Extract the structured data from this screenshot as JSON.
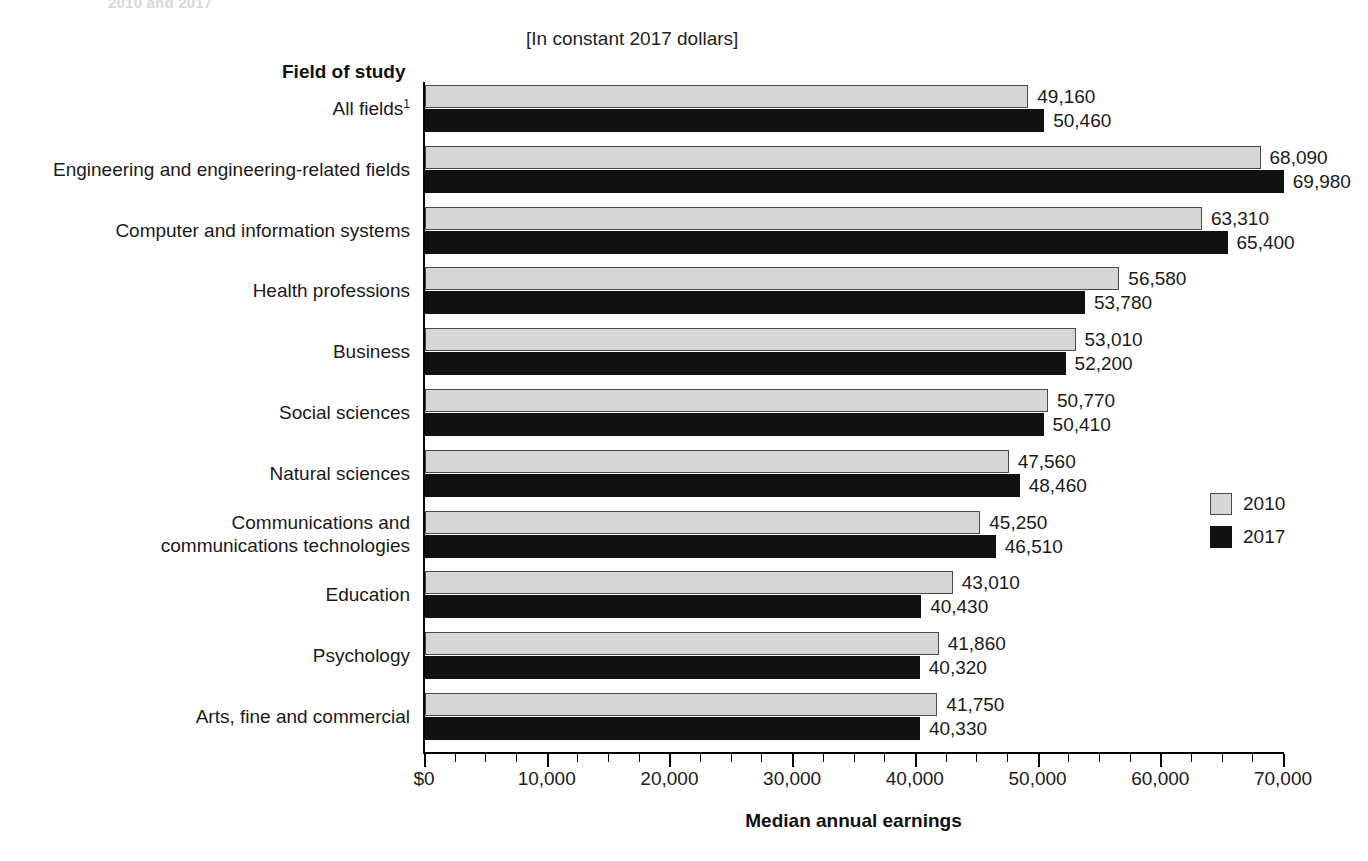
{
  "top_remnant": "2010 and 2017",
  "subtitle": "[In constant 2017 dollars]",
  "field_of_study_header": "Field of study",
  "x_axis_title": "Median annual earnings",
  "legend": {
    "position": "right",
    "entries": [
      {
        "label": "2010",
        "color": "#d6d6d6"
      },
      {
        "label": "2017",
        "color": "#111111"
      }
    ]
  },
  "colors": {
    "series_2010": "#d6d6d6",
    "series_2017": "#111111",
    "axis": "#000000",
    "text": "#1a1a1a"
  },
  "chart_data": {
    "type": "bar",
    "orientation": "horizontal",
    "title": "",
    "subtitle": "[In constant 2017 dollars]",
    "xlabel": "Median annual earnings",
    "ylabel": "Field of study",
    "xlim": [
      0,
      70000
    ],
    "grid": false,
    "legend_position": "right",
    "tick_labels": [
      "$0",
      "10,000",
      "20,000",
      "30,000",
      "40,000",
      "50,000",
      "60,000",
      "70,000"
    ],
    "tick_values": [
      0,
      10000,
      20000,
      30000,
      40000,
      50000,
      60000,
      70000
    ],
    "minor_tick_interval": 2500,
    "categories": [
      "All fields1",
      "Engineering and engineering-related fields",
      "Computer and information systems",
      "Health professions",
      "Business",
      "Social sciences",
      "Natural sciences",
      "Communications and communications technologies",
      "Education",
      "Psychology",
      "Arts, fine and commercial"
    ],
    "category_display": [
      {
        "lines": [
          "All fields"
        ],
        "footnote": "1"
      },
      {
        "lines": [
          "Engineering and engineering-related fields"
        ],
        "footnote": ""
      },
      {
        "lines": [
          "Computer and information systems"
        ],
        "footnote": ""
      },
      {
        "lines": [
          "Health professions"
        ],
        "footnote": ""
      },
      {
        "lines": [
          "Business"
        ],
        "footnote": ""
      },
      {
        "lines": [
          "Social sciences"
        ],
        "footnote": ""
      },
      {
        "lines": [
          "Natural sciences"
        ],
        "footnote": ""
      },
      {
        "lines": [
          "Communications and",
          "communications technologies"
        ],
        "footnote": ""
      },
      {
        "lines": [
          "Education"
        ],
        "footnote": ""
      },
      {
        "lines": [
          "Psychology"
        ],
        "footnote": ""
      },
      {
        "lines": [
          "Arts, fine and commercial"
        ],
        "footnote": ""
      }
    ],
    "series": [
      {
        "name": "2010",
        "values": [
          49160,
          68090,
          63310,
          56580,
          53010,
          50770,
          47560,
          45250,
          43010,
          41860,
          41750
        ],
        "labels": [
          "49,160",
          "68,090",
          "63,310",
          "56,580",
          "53,010",
          "50,770",
          "47,560",
          "45,250",
          "43,010",
          "41,860",
          "41,750"
        ]
      },
      {
        "name": "2017",
        "values": [
          50460,
          69980,
          65400,
          53780,
          52200,
          50410,
          48460,
          46510,
          40430,
          40320,
          40330
        ],
        "labels": [
          "50,460",
          "69,980",
          "65,400",
          "53,780",
          "52,200",
          "50,410",
          "48,460",
          "46,510",
          "40,430",
          "40,320",
          "40,330"
        ]
      }
    ]
  }
}
